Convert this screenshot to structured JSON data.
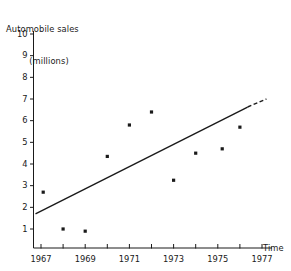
{
  "chart_data": {
    "type": "scatter",
    "title": "",
    "ylabel_lines": [
      "Automobile sales",
      "(millions)"
    ],
    "ylabel": "Automobile sales (millions)",
    "xlabel": "Time",
    "xlim": [
      1966.3,
      1977.6
    ],
    "ylim": [
      0,
      10
    ],
    "grid": false,
    "legend": null,
    "x_ticks_major": [
      1967,
      1969,
      1971,
      1973,
      1975,
      1977
    ],
    "x_ticks_all": [
      1967,
      1968,
      1969,
      1970,
      1971,
      1972,
      1973,
      1974,
      1975,
      1976,
      1977
    ],
    "x_tick_labels": [
      "1967",
      "1969",
      "1971",
      "1973",
      "1975",
      "1977"
    ],
    "y_ticks": [
      1,
      2,
      3,
      4,
      5,
      6,
      7,
      8,
      9,
      10
    ],
    "y_tick_labels": [
      "1",
      "2",
      "3",
      "4",
      "5",
      "6",
      "7",
      "8",
      "9",
      "10"
    ],
    "x": [
      1967.1,
      1968.0,
      1969.0,
      1970.0,
      1971.0,
      1972.0,
      1973.0,
      1974.0,
      1975.2,
      1976.0
    ],
    "values": [
      2.7,
      1.0,
      0.9,
      4.35,
      5.8,
      6.4,
      3.25,
      4.5,
      4.7,
      5.7
    ],
    "points": [
      {
        "x": 1967.1,
        "y": 2.7
      },
      {
        "x": 1968.0,
        "y": 1.0
      },
      {
        "x": 1969.0,
        "y": 0.9
      },
      {
        "x": 1970.0,
        "y": 4.35
      },
      {
        "x": 1971.0,
        "y": 5.8
      },
      {
        "x": 1972.0,
        "y": 6.4
      },
      {
        "x": 1973.0,
        "y": 3.25
      },
      {
        "x": 1974.0,
        "y": 4.5
      },
      {
        "x": 1975.2,
        "y": 4.7
      },
      {
        "x": 1976.0,
        "y": 5.7
      }
    ],
    "trend_line": {
      "solid": {
        "x0": 1966.75,
        "y0": 1.7,
        "x1": 1976.35,
        "y1": 6.63
      },
      "dashed": {
        "x0": 1976.35,
        "y0": 6.63,
        "x1": 1977.2,
        "y1": 7.0
      },
      "style": "solid-then-dashed"
    },
    "marker_color": "#1a1a1a",
    "line_color": "#1a1a1a",
    "axis_color": "#1a1a1a"
  },
  "axes": {
    "y_title_line1": "Automobile sales",
    "y_title_line2": "(millions)",
    "x_title": "Time"
  },
  "colors": {
    "background": "#ffffff",
    "ink": "#1a1a1a"
  }
}
